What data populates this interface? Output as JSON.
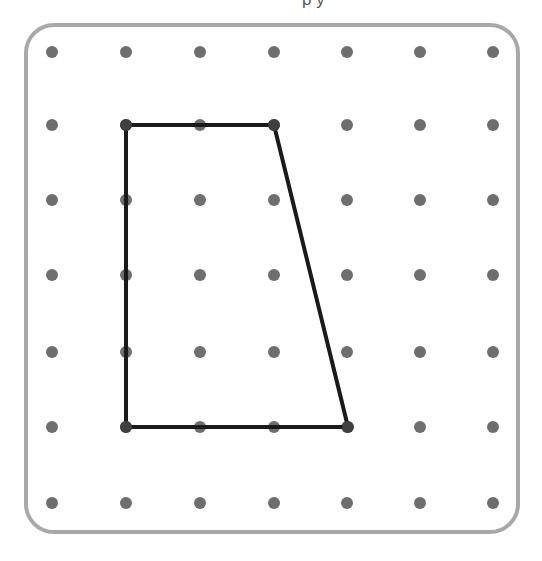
{
  "canvas": {
    "width": 542,
    "height": 561,
    "background": "#ffffff"
  },
  "board": {
    "label": "geoboard",
    "border_color": "#a8a8a8",
    "border_width": 4,
    "corner_radius": 28,
    "fill": "#ffffff",
    "x": 26,
    "y": 25,
    "width": 492,
    "height": 507
  },
  "grid": {
    "rows": 7,
    "columns": 7,
    "dot_color": "#6e6e6e",
    "dot_radius": 6,
    "column_x": [
      52,
      126,
      200,
      274,
      347,
      420,
      493
    ],
    "row_y": [
      52,
      125,
      200,
      275,
      352,
      427,
      503
    ]
  },
  "shape": {
    "name": "quadrilateral",
    "kind": "trapezoid",
    "stroke_color": "#1a1a1a",
    "stroke_width": 4,
    "fill": "none",
    "vertex_labels": [
      "top-left",
      "top-right",
      "bottom-right",
      "bottom-left"
    ],
    "vertices_px": [
      [
        126,
        125
      ],
      [
        274,
        125
      ],
      [
        348,
        427
      ],
      [
        126,
        427
      ]
    ],
    "vertices_grid": [
      [
        1,
        1
      ],
      [
        3,
        1
      ],
      [
        4,
        5
      ],
      [
        1,
        5
      ]
    ],
    "points_string": "126,125 274,125 348,427 126,427"
  },
  "clipped_header": {
    "remnant_text": "p y",
    "note": "partially cropped glyph descenders at top edge"
  }
}
